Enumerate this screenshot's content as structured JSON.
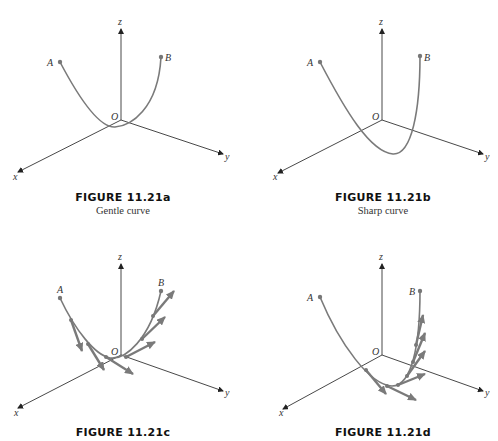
{
  "panels": [
    {
      "id": "a",
      "title": "FIGURE 11.21a",
      "subtitle": "Gentle curve"
    },
    {
      "id": "b",
      "title": "FIGURE 11.21b",
      "subtitle": "Sharp curve"
    },
    {
      "id": "c",
      "title": "FIGURE 11.21c",
      "subtitle": ""
    },
    {
      "id": "d",
      "title": "FIGURE 11.21d",
      "subtitle": ""
    }
  ],
  "labels": {
    "x": "x",
    "y": "y",
    "z": "z",
    "origin": "O",
    "point_a": "A",
    "point_b": "B"
  },
  "colors": {
    "curve": "#7a7a7a",
    "axis": "#333333"
  }
}
